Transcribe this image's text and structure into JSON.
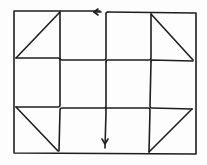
{
  "diagram": {
    "title": "Quilt block path diagram",
    "stroke_color": "#1e1e1e",
    "background_color": "#fdfdfd",
    "frame": {
      "x1": 14,
      "y1": 11,
      "x2": 196,
      "y2": 153
    },
    "grid": {
      "columns": 3,
      "rows": 3,
      "vertical_lines_x": [
        60,
        106,
        150
      ],
      "horizontal_lines_y": [
        59,
        107
      ]
    },
    "triangles": [
      {
        "name": "top-left",
        "points": "60,12 16,58 60,58"
      },
      {
        "name": "top-right",
        "points": "151,14 193,60 151,60"
      },
      {
        "name": "bottom-left",
        "points": "16,107 58,151 58,107"
      },
      {
        "name": "bottom-right",
        "points": "192,109 149,152 149,109"
      }
    ],
    "arrows": [
      {
        "name": "top-arrow",
        "direction": "left",
        "x": 96,
        "y": 12
      },
      {
        "name": "bottom-arrow",
        "direction": "down",
        "x": 105,
        "y": 142
      }
    ]
  }
}
